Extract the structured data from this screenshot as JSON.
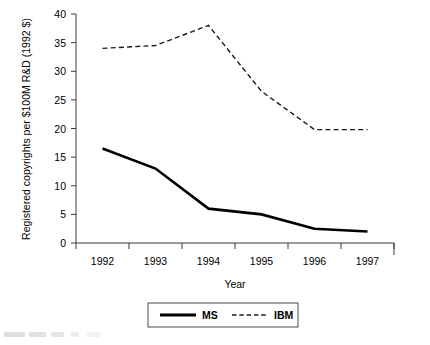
{
  "chart_data": {
    "type": "line",
    "title": "",
    "xlabel": "Year",
    "ylabel": "Registered copyrights per $100M R&D (1992 $)",
    "categories": [
      "1992",
      "1993",
      "1994",
      "1995",
      "1996",
      "1997"
    ],
    "xlim": [
      0,
      6
    ],
    "ylim": [
      0,
      40
    ],
    "yticks": [
      "0",
      "5",
      "10",
      "15",
      "20",
      "25",
      "30",
      "35",
      "40"
    ],
    "ytick_values": [
      0,
      5,
      10,
      15,
      20,
      25,
      30,
      35,
      40
    ],
    "grid": false,
    "legend_position": "bottom-center",
    "series": [
      {
        "name": "MS",
        "style": "solid",
        "color": "#000000",
        "values": [
          16.5,
          13.0,
          6.0,
          5.0,
          2.5,
          2.0
        ]
      },
      {
        "name": "IBM",
        "style": "dashed",
        "color": "#1a1a1a",
        "values": [
          34.0,
          34.5,
          38.0,
          26.5,
          19.8,
          19.8
        ]
      }
    ]
  },
  "legend": {
    "entries": [
      {
        "label": "MS"
      },
      {
        "label": "IBM"
      }
    ]
  },
  "axes": {
    "x_title": "Year",
    "y_title": "Registered copyrights per $100M R&D (1992 $)"
  },
  "colors": {
    "background": "#ffffff",
    "axis": "#3a3a3a",
    "ms_series": "#000000",
    "ibm_series": "#1a1a1a",
    "text": "#000000"
  }
}
